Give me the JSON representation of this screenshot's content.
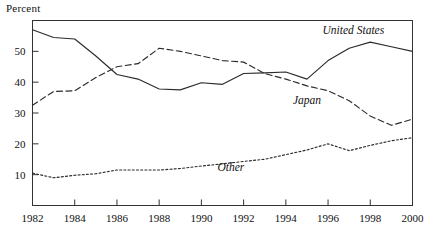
{
  "chart_data": {
    "type": "line",
    "title": "",
    "ylabel": "Percent",
    "xlabel": "",
    "ylim": [
      0,
      60
    ],
    "xlim": [
      1982,
      2000
    ],
    "grid": false,
    "legend_position": "inline-annotations",
    "yticks": [
      10,
      20,
      30,
      40,
      50
    ],
    "xticks": [
      1982,
      1984,
      1986,
      1988,
      1990,
      1992,
      1994,
      1996,
      1998,
      2000
    ],
    "x": [
      1982,
      1983,
      1984,
      1985,
      1986,
      1987,
      1988,
      1989,
      1990,
      1991,
      1992,
      1993,
      1994,
      1995,
      1996,
      1997,
      1998,
      1999,
      2000
    ],
    "series": [
      {
        "name": "United States",
        "style": "solid",
        "label_text": "United States",
        "values": [
          57.0,
          54.5,
          54.0,
          48.5,
          42.5,
          41.0,
          37.8,
          37.5,
          39.8,
          39.3,
          42.8,
          43.0,
          43.3,
          41.0,
          47.0,
          51.0,
          53.0,
          51.5,
          50.0
        ]
      },
      {
        "name": "Japan",
        "style": "dashed",
        "label_text": "Japan",
        "values": [
          32.5,
          37.0,
          37.2,
          41.5,
          45.0,
          46.0,
          51.0,
          50.0,
          48.5,
          47.0,
          46.5,
          42.8,
          41.0,
          38.8,
          37.2,
          34.0,
          29.0,
          26.0,
          28.0
        ]
      },
      {
        "name": "Other",
        "style": "dotted",
        "label_text": "Other",
        "values": [
          10.5,
          9.0,
          9.8,
          10.3,
          11.5,
          11.5,
          11.5,
          12.0,
          12.8,
          13.5,
          14.3,
          15.0,
          16.5,
          18.0,
          20.0,
          17.8,
          19.5,
          21.0,
          22.0
        ]
      }
    ],
    "annotations": [
      {
        "text": "United States",
        "x": 1997.2,
        "y": 55.6
      },
      {
        "text": "Japan",
        "x": 1995.0,
        "y": 33.0
      },
      {
        "text": "Other",
        "x": 1991.4,
        "y": 11.2
      }
    ],
    "colors": {
      "line": "#2b2b2b",
      "axis": "#333333",
      "text": "#111111",
      "background": "#ffffff"
    }
  }
}
